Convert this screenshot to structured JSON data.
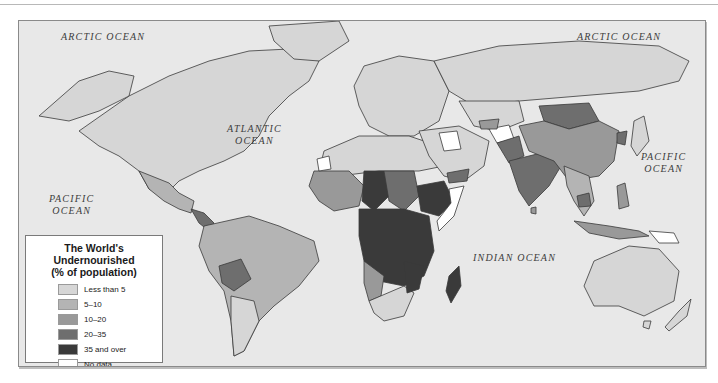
{
  "map": {
    "title": "The World's Undernourished",
    "subtitle": "(% of population)",
    "ocean_labels": {
      "arctic_west": "ARCTIC OCEAN",
      "arctic_east": "ARCTIC OCEAN",
      "atlantic_line1": "ATLANTIC",
      "atlantic_line2": "OCEAN",
      "pacific_west_line1": "PACIFIC",
      "pacific_west_line2": "OCEAN",
      "pacific_east_line1": "PACIFIC",
      "pacific_east_line2": "OCEAN",
      "indian": "INDIAN OCEAN"
    },
    "colors": {
      "ocean": "#e8e8e8",
      "less_than_5": "#d6d6d6",
      "5_10": "#b4b4b4",
      "10_20": "#999999",
      "20_35": "#6e6e6e",
      "35_and_over": "#3a3a3a",
      "no_data": "#ffffff",
      "border": "#3a3a3a"
    },
    "legend": [
      {
        "label": "Less than 5",
        "color": "#d6d6d6"
      },
      {
        "label": "5–10",
        "color": "#b4b4b4"
      },
      {
        "label": "10–20",
        "color": "#999999"
      },
      {
        "label": "20–35",
        "color": "#6e6e6e"
      },
      {
        "label": "35 and over",
        "color": "#3a3a3a"
      },
      {
        "label": "No data",
        "color": "#ffffff"
      }
    ]
  }
}
